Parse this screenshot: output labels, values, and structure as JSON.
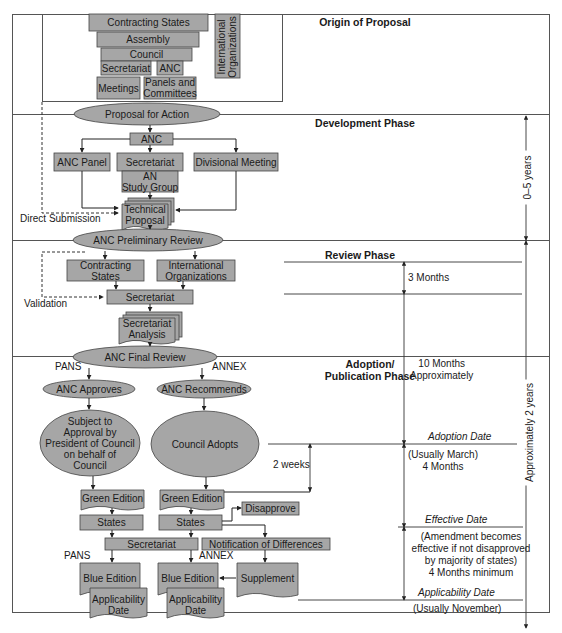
{
  "colors": {
    "box_fill": "#a6a6a6",
    "stroke": "#3a3a3a",
    "line": "#333333",
    "background": "#ffffff"
  },
  "phases": {
    "origin": "Origin of Proposal",
    "development": "Development Phase",
    "review": "Review Phase",
    "adoption_line1": "Adoption/",
    "adoption_line2": "Publication Phase"
  },
  "origin": {
    "contracting_states": "Contracting States",
    "assembly": "Assembly",
    "council": "Council",
    "secretariat": "Secretariat",
    "anc": "ANC",
    "meetings": "Meetings",
    "panels_line1": "Panels and",
    "panels_line2": "Committees",
    "intl_line1": "International",
    "intl_line2": "Organizations"
  },
  "development": {
    "proposal_for_action": "Proposal for Action",
    "anc": "ANC",
    "anc_panel": "ANC Panel",
    "secretariat": "Secretariat",
    "divisional_meeting": "Divisional Meeting",
    "an_study_line1": "AN",
    "an_study_line2": "Study Group",
    "technical_line1": "Technical",
    "technical_line2": "Proposal",
    "direct_submission": "Direct Submission"
  },
  "review": {
    "preliminary_review": "ANC Preliminary Review",
    "contracting_line1": "Contracting",
    "contracting_line2": "States",
    "intl_line1": "International",
    "intl_line2": "Organizations",
    "secretariat": "Secretariat",
    "validation": "Validation",
    "analysis_line1": "Secretariat",
    "analysis_line2": "Analysis"
  },
  "adoption": {
    "final_review": "ANC Final Review",
    "pans": "PANS",
    "annex": "ANNEX",
    "anc_approves": "ANC Approves",
    "anc_recommends": "ANC Recommends",
    "subject_lines": [
      "Subject to",
      "Approval by",
      "President of Council",
      "on behalf of",
      "Council"
    ],
    "council_adopts": "Council Adopts",
    "green_edition_pans": "Green Edition",
    "green_edition_annex": "Green Edition",
    "disapprove": "Disapprove",
    "states_pans": "States",
    "states_annex": "States",
    "secretariat": "Secretariat",
    "notification": "Notification of Differences",
    "pans_label2": "PANS",
    "annex_label2": "ANNEX",
    "blue_edition_pans": "Blue Edition",
    "blue_edition_annex": "Blue Edition",
    "supplement": "Supplement",
    "applicability_pans_line1": "Applicability",
    "applicability_pans_line2": "Date",
    "applicability_annex_line1": "Applicability",
    "applicability_annex_line2": "Date"
  },
  "timeline": {
    "zero_five_years": "0–5 years",
    "approx_two_years": "Approximately 2 years",
    "three_months": "3 Months",
    "ten_months_line1": "10 Months",
    "ten_months_line2": "Approximately",
    "two_weeks": "2 weeks",
    "adoption_date": "Adoption Date",
    "usually_march": "(Usually March)",
    "four_months": "4 Months",
    "effective_date": "Effective Date",
    "amend_line1": "(Amendment becomes",
    "amend_line2": "effective if not disapproved",
    "amend_line3": "by majority of states)",
    "amend_line4": "4 Months minimum",
    "applicability_date": "Applicability Date",
    "usually_november": "(Usually November)"
  }
}
